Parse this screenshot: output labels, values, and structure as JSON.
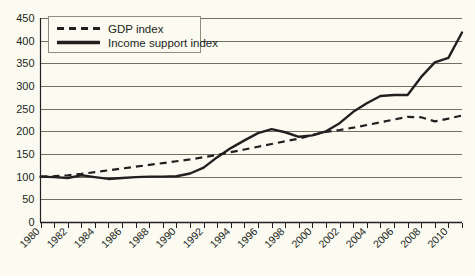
{
  "chart_data": {
    "type": "line",
    "title": "",
    "subtitle": "",
    "xlabel": "",
    "ylabel": "",
    "xlim": [
      1980,
      2011
    ],
    "ylim": [
      0,
      450
    ],
    "ytick_step": 50,
    "yticks": [
      0,
      50,
      100,
      150,
      200,
      250,
      300,
      350,
      400,
      450
    ],
    "ytick_labels": [
      "0",
      "50",
      "100",
      "150",
      "200",
      "250",
      "300",
      "350",
      "400",
      "450"
    ],
    "x": [
      1980,
      1981,
      1982,
      1983,
      1984,
      1985,
      1986,
      1987,
      1988,
      1989,
      1990,
      1991,
      1992,
      1993,
      1994,
      1995,
      1996,
      1997,
      1998,
      1999,
      2000,
      2001,
      2002,
      2003,
      2004,
      2005,
      2006,
      2007,
      2008,
      2009,
      2010,
      2011
    ],
    "xtick_labels": [
      "1980",
      "1982",
      "1984",
      "1986",
      "1988",
      "1990",
      "1992",
      "1994",
      "1996",
      "1998",
      "2000",
      "2002",
      "2004",
      "2006",
      "2008",
      "2010"
    ],
    "xtick_label_rotation": -45,
    "grid": true,
    "grid_axis": "y",
    "legend_position": "top-left",
    "series": [
      {
        "name": "GDP index",
        "style": "dashed",
        "color": "#231f20",
        "values": [
          100,
          101,
          103,
          106,
          110,
          114,
          118,
          122,
          126,
          130,
          134,
          138,
          143,
          148,
          154,
          160,
          166,
          172,
          178,
          184,
          192,
          199,
          203,
          208,
          214,
          220,
          226,
          232,
          231,
          222,
          228,
          235
        ]
      },
      {
        "name": "Income support index",
        "style": "solid",
        "color": "#231f20",
        "values": [
          100,
          99,
          97,
          103,
          99,
          95,
          97,
          99,
          100,
          100,
          101,
          107,
          120,
          143,
          163,
          180,
          196,
          205,
          198,
          188,
          191,
          200,
          218,
          243,
          262,
          278,
          280,
          280,
          320,
          352,
          362,
          418
        ]
      }
    ],
    "annotations": []
  },
  "legend": {
    "items": [
      {
        "label": "GDP index",
        "style": "dashed"
      },
      {
        "label": "Income support index",
        "style": "solid"
      }
    ]
  },
  "colors": {
    "background": "#fbfbf2",
    "plot_background": "#fbfbf2",
    "gridline": "#6f7061",
    "axis": "#231f20",
    "series_line": "#231f20",
    "legend_border": "#8d8f7c",
    "text": "#231f20"
  }
}
